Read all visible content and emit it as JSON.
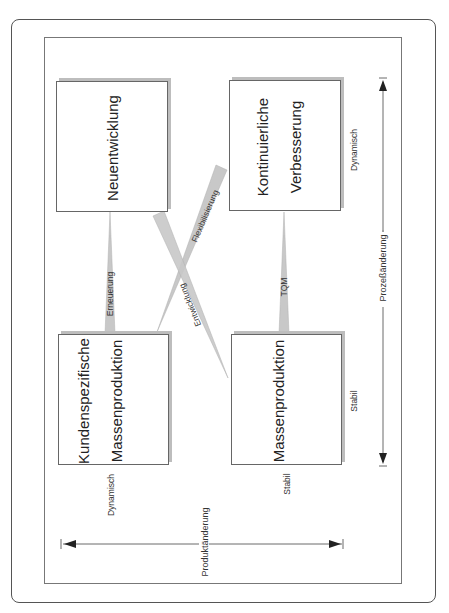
{
  "diagram": {
    "boxes": {
      "neuentwicklung": {
        "lines": [
          "Neuentwicklung"
        ]
      },
      "kontinuierliche_verbesserung": {
        "lines": [
          "Kontinuierliche",
          "Verbesserung"
        ]
      },
      "kundenspezifische_massenproduktion": {
        "lines": [
          "Kundenspezifische",
          "Massenproduktion"
        ]
      },
      "massenproduktion": {
        "lines": [
          "Massenproduktion"
        ]
      }
    },
    "transitions": {
      "erneuerung": "Erneuerung",
      "tqm": "TQM",
      "flexibilisierung": "Flexibilisierung",
      "entwicklung": "Entwicklung"
    },
    "axes": {
      "process": {
        "label": "Prozeßänderung",
        "start": "Stabil",
        "end": "Dynamisch"
      },
      "product": {
        "label": "Produktänderung",
        "start": "Dynamisch",
        "end": "Stabil"
      }
    },
    "colors": {
      "arrow_fill": "#c8c8c8",
      "box_border": "#666666",
      "box_shadow": "#bdbdbd"
    }
  }
}
